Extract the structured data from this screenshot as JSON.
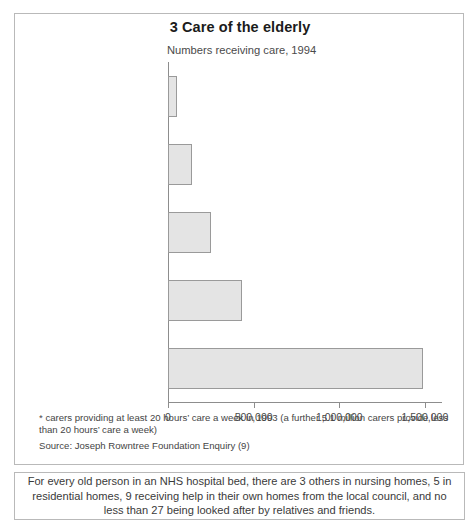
{
  "chart": {
    "title": "3 Care of the elderly",
    "subtitle": "Numbers receiving care, 1994"
  },
  "footnotes": {
    "asterisk_note": "* carers providing at least 20 hours’ care a week in 1993 (a further 5.1 million carers provide less than 20 hours’ care a week)",
    "source": "Source: Joseph Rowntree Foundation Enquiry (9)"
  },
  "caption": {
    "text": "For every old person in an NHS hospital bed, there are 3 others in nursing homes, 5 in residential homes, 9 receiving help in their own homes from the local council, and no less than 27 being looked after by relatives and friends."
  },
  "axis": {
    "tick_labels": [
      "0",
      "500,000",
      "1,000,000",
      "1,500,000"
    ]
  },
  "categories": [
    {
      "label": "NHS hospitals",
      "star": ""
    },
    {
      "label": "Nursing homes",
      "star": ""
    },
    {
      "label": "Residential homes",
      "star": ""
    },
    {
      "label": "Help at home from council",
      "star": ""
    },
    {
      "label": "Help from family and friends",
      "star": "*"
    }
  ],
  "chart_data": {
    "type": "bar",
    "orientation": "horizontal",
    "title": "3 Care of the elderly",
    "subtitle": "Numbers receiving care, 1994",
    "xlabel": "",
    "ylabel": "",
    "xlim": [
      0,
      1600000
    ],
    "xticks": [
      0,
      500000,
      1000000,
      1500000
    ],
    "xtick_labels": [
      "0",
      "500,000",
      "1,000,000",
      "1,500,000"
    ],
    "grid": false,
    "legend": "none",
    "bar_fill_color": "#e4e4e4",
    "bar_edge_color": "#9a9a9a",
    "categories": [
      "NHS hospitals",
      "Nursing homes",
      "Residential homes",
      "Help at home from council",
      "Help from family and friends*"
    ],
    "values": [
      50000,
      140000,
      250000,
      435000,
      1490000
    ]
  }
}
